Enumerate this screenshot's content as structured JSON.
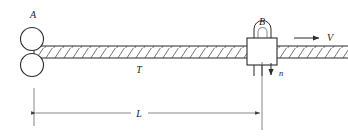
{
  "figure": {
    "labels": {
      "roller_assembly": "A",
      "die_block": "B",
      "bar": "T",
      "length": "L",
      "velocity": "V",
      "normal_force": "n"
    },
    "colors": {
      "line": "#2b2b2b",
      "thin_line": "#555555",
      "hatch": "#3a3a3a",
      "background": "#ffffff",
      "text": "#1a1a1a"
    },
    "geometry": {
      "bar_left_x": 34,
      "bar_right_x": 348,
      "bar_top_y": 46,
      "bar_bottom_y": 58,
      "roller_center_x": 32,
      "roller_upper_center_y": 40,
      "roller_lower_center_y": 64,
      "roller_radius": 11,
      "block_x": 247,
      "block_y": 38,
      "block_w": 30,
      "block_h": 27,
      "dimension_y": 113,
      "dimension_left_x": 34,
      "dimension_right_x": 262
    }
  }
}
